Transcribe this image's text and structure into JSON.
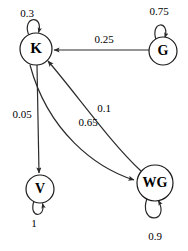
{
  "diagram": {
    "colors": {
      "stroke": "#2b2b2b",
      "node_stroke": "#1a1a1a",
      "node_fill": "#ffffff",
      "text": "#000000",
      "background": "#ffffff"
    },
    "nodes": [
      {
        "id": "K",
        "label": "K",
        "cx": 36,
        "cy": 49,
        "r": 16,
        "font_size": 15
      },
      {
        "id": "G",
        "label": "G",
        "cx": 163,
        "cy": 51,
        "r": 14,
        "font_size": 14
      },
      {
        "id": "V",
        "label": "V",
        "cx": 40,
        "cy": 189,
        "r": 14,
        "font_size": 14
      },
      {
        "id": "WG",
        "label": "WG",
        "cx": 155,
        "cy": 183,
        "r": 18,
        "font_size": 14
      }
    ],
    "edges": [
      {
        "id": "k-self",
        "from": "K",
        "to": "K",
        "label": "0.3",
        "label_x": 27,
        "label_y": 14,
        "type": "self-loop"
      },
      {
        "id": "g-self",
        "from": "G",
        "to": "G",
        "label": "0.75",
        "label_x": 159,
        "label_y": 12,
        "type": "self-loop"
      },
      {
        "id": "v-self",
        "from": "V",
        "to": "V",
        "label": "1",
        "label_x": 34,
        "label_y": 224,
        "type": "self-loop"
      },
      {
        "id": "wg-self",
        "from": "WG",
        "to": "WG",
        "label": "0.9",
        "label_x": 155,
        "label_y": 237,
        "type": "self-loop"
      },
      {
        "id": "g-to-k",
        "from": "G",
        "to": "K",
        "label": "0.25",
        "label_x": 104,
        "label_y": 40,
        "type": "straight"
      },
      {
        "id": "k-to-v",
        "from": "K",
        "to": "V",
        "label": "0.05",
        "label_x": 22,
        "label_y": 115,
        "type": "straight"
      },
      {
        "id": "wg-to-k",
        "from": "WG",
        "to": "K",
        "label": "0.1",
        "label_x": 104,
        "label_y": 109,
        "type": "curve"
      },
      {
        "id": "k-to-wg",
        "from": "K",
        "to": "WG",
        "label": "0.65",
        "label_x": 88,
        "label_y": 123,
        "type": "curve"
      }
    ]
  }
}
